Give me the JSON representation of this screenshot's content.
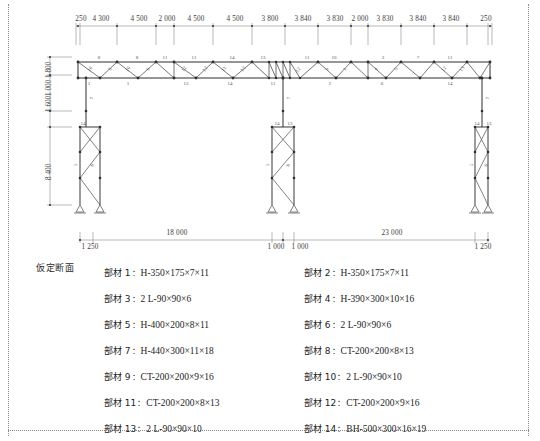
{
  "drawing": {
    "section_label": "仮定断面",
    "top_dimensions": [
      "250",
      "4 300",
      "4 500",
      "2 000",
      "4 500",
      "4 500",
      "3 800",
      "3 840",
      "3 830",
      "2 000",
      "3 830",
      "3 840",
      "3 840",
      "250"
    ],
    "left_dimensions": [
      "1 800",
      "1 600",
      "1 000",
      "8 400"
    ],
    "bottom_dimensions": {
      "ticks": [
        "1 250",
        "1 000",
        "1 000",
        "1 250"
      ],
      "spans": [
        "18 000",
        "23 000"
      ]
    },
    "truss_member_numbers": [
      "8",
      "10",
      "9",
      "1",
      "8",
      "10",
      "9",
      "1",
      "11",
      "12",
      "11",
      "12",
      "13",
      "14",
      "11",
      "12",
      "14",
      "13",
      "11",
      "12",
      "11",
      "10",
      "9",
      "1",
      "2",
      "3",
      "4",
      "5",
      "6",
      "7"
    ],
    "column_member_numbers": [
      "7",
      "5",
      "6",
      "4",
      "3",
      "2",
      "14",
      "13"
    ],
    "support_symbol": "pin-support-triangle"
  },
  "members": [
    {
      "no": "部材 1",
      "spec": "H-350×175×7×11"
    },
    {
      "no": "部材 2",
      "spec": "H-350×175×7×11"
    },
    {
      "no": "部材 3",
      "spec": "2 L-90×90×6"
    },
    {
      "no": "部材 4",
      "spec": "H-390×300×10×16"
    },
    {
      "no": "部材 5",
      "spec": "H-400×200×8×11"
    },
    {
      "no": "部材 6",
      "spec": "2 L-90×90×6"
    },
    {
      "no": "部材 7",
      "spec": "H-440×300×11×18"
    },
    {
      "no": "部材 8",
      "spec": "CT-200×200×8×13"
    },
    {
      "no": "部材 9",
      "spec": "CT-200×200×9×16"
    },
    {
      "no": "部材 10",
      "spec": "2 L-90×90×10"
    },
    {
      "no": "部材 11",
      "spec": "CT-200×200×8×13"
    },
    {
      "no": "部材 12",
      "spec": "CT-200×200×9×16"
    },
    {
      "no": "部材 13",
      "spec": "2 L-90×90×10"
    },
    {
      "no": "部材 14",
      "spec": "BH-500×300×16×19"
    }
  ],
  "colors": {
    "line": "#4a4a4a",
    "heavy": "#2e2e2e",
    "thin": "#8a8a8a",
    "text": "#242424"
  }
}
